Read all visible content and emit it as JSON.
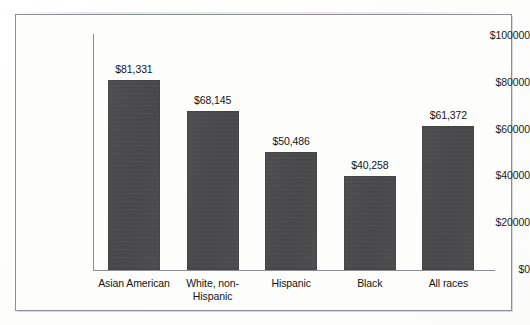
{
  "chart_data": {
    "type": "bar",
    "title": "",
    "subtitle": "",
    "xlabel": "",
    "ylabel": "",
    "categories": [
      "Asian American",
      "White, non-Hispanic",
      "Hispanic",
      "Black",
      "All races"
    ],
    "category_lines": [
      [
        "Asian American"
      ],
      [
        "White, non-",
        "Hispanic"
      ],
      [
        "Hispanic"
      ],
      [
        "Black"
      ],
      [
        "All races"
      ]
    ],
    "values": [
      81331,
      68145,
      50486,
      40258,
      61372
    ],
    "value_labels": [
      "$81,331",
      "$68,145",
      "$50,486",
      "$40,258",
      "$61,372"
    ],
    "ylim": [
      0,
      100000
    ],
    "ytick_values": [
      0,
      20000,
      40000,
      60000,
      80000,
      100000
    ],
    "ytick_labels": [
      "$0",
      "$20000",
      "$40000",
      "$60000",
      "$80000",
      "$100000"
    ],
    "grid": false,
    "legend": null,
    "bar_color": "#4b4b4e",
    "axis_color": "#8a8c90",
    "text_color": "#141414",
    "background_color": "#fdfdfc",
    "frame_color": "#8d8f93"
  }
}
